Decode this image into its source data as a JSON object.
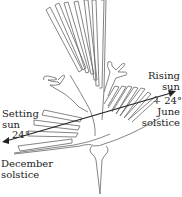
{
  "figure": {
    "line_color": "#555555",
    "arrow_color": "#222222",
    "background": "#ffffff"
  },
  "labels": {
    "rising": {
      "line1": "Rising",
      "line2": "sun",
      "angle": "+ 24°",
      "line3": "June",
      "line4": "solstice"
    },
    "setting": {
      "line1": "Setting",
      "line2": "sun",
      "angle": "24°"
    },
    "december": {
      "line1": "December",
      "line2": "solstice"
    }
  },
  "alignment_arrow": {
    "start": [
      3,
      142
    ],
    "end": [
      175,
      92
    ],
    "description": "double-headed line from setting sun (December solstice) to rising sun (June solstice)"
  }
}
